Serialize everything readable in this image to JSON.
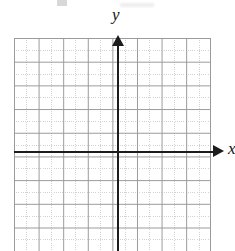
{
  "figure": {
    "type": "cartesian-coordinate-grid",
    "title": "",
    "background_color": "#ffffff"
  },
  "axes": {
    "x_axis": {
      "label": "x",
      "color": "#1c1c1c",
      "arrow": "right",
      "arrow_icon": "arrow-right-icon"
    },
    "y_axis": {
      "label": "y",
      "color": "#1c1c1c",
      "arrow": "up",
      "arrow_icon": "arrow-up-icon"
    },
    "origin": {
      "x": 118,
      "y": 152
    }
  },
  "grid": {
    "major_color": "#9a9a9a",
    "minor_color": "#d2d2d2",
    "major_cell_width": 24.6,
    "major_cell_height": 23.7,
    "minor_subdivisions": 2,
    "columns": 8,
    "rows": 9,
    "cells_left_of_origin": 4,
    "cells_right_of_origin": 4,
    "cells_above_origin": 5,
    "cells_below_origin": 4
  },
  "chart_data": {
    "type": "scatter",
    "title": "",
    "xlabel": "x",
    "ylabel": "y",
    "x": [],
    "y": [],
    "series": [],
    "xlim": [
      -4,
      4
    ],
    "ylim": [
      -4,
      5
    ],
    "grid": true,
    "legend": false,
    "annotations": []
  }
}
